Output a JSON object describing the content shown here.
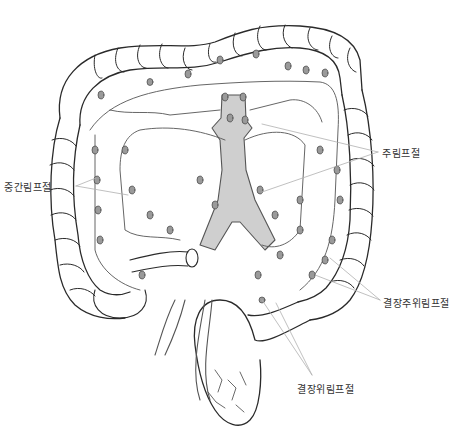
{
  "diagram": {
    "colors": {
      "outline": "#2a2a2a",
      "vessel_fill": "#cfcfcf",
      "node_fill": "#9a9a9a",
      "leader_line": "#b0b0b0",
      "label_text": "#333333",
      "background": "#ffffff"
    },
    "labels": [
      {
        "id": "intermediate",
        "text": "중간림프절",
        "x": 4,
        "y": 179
      },
      {
        "id": "main",
        "text": "주림프절",
        "x": 382,
        "y": 145
      },
      {
        "id": "pericolic",
        "text": "결장주위림프절",
        "x": 383,
        "y": 295
      },
      {
        "id": "epicolic",
        "text": "결장위림프절",
        "x": 297,
        "y": 381
      }
    ]
  }
}
